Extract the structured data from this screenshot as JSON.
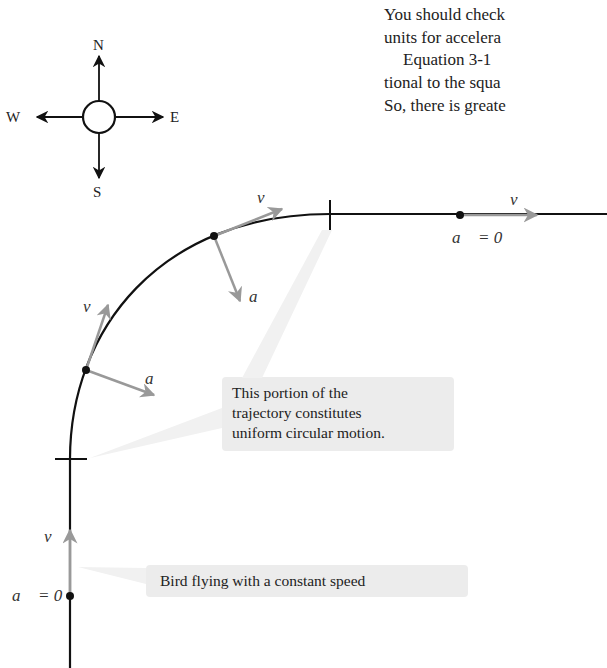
{
  "body_text": {
    "lines": [
      "You should check",
      "units for accelera",
      "Equation 3-1",
      "tional to the squa",
      "So, there is greate"
    ]
  },
  "compass": {
    "north": "N",
    "south": "S",
    "east": "E",
    "west": "W"
  },
  "labels": {
    "velocity": "v⃗",
    "acceleration": "a⃗",
    "zero_accel_top": "a⃗ = 0",
    "zero_accel_bottom": "a⃗ = 0",
    "a_symbol": "a",
    "v_symbol": "v",
    "equals_zero": "= 0"
  },
  "callouts": {
    "circular": [
      "This portion of the",
      "trajectory constitutes",
      "uniform circular motion."
    ],
    "constant": "Bird flying with a constant speed"
  },
  "colors": {
    "trajectory": "#111111",
    "vector": "#999999",
    "callout_bg": "#ececec"
  }
}
